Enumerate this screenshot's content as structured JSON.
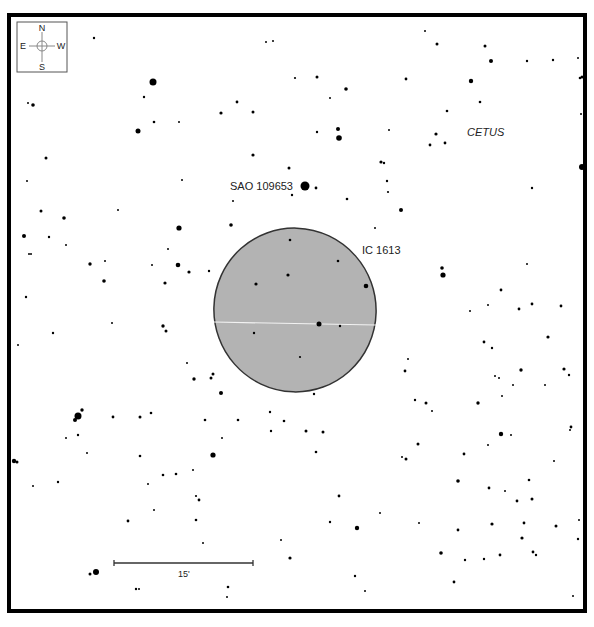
{
  "chart": {
    "type": "star-chart",
    "frame": {
      "x": 9,
      "y": 15,
      "w": 576,
      "h": 596,
      "stroke": "#000000",
      "stroke_width": 4
    },
    "compass": {
      "x": 17,
      "y": 22,
      "w": 50,
      "h": 50,
      "labels": {
        "north": "N",
        "south": "S",
        "east": "E",
        "west": "W"
      }
    },
    "object": {
      "name": "IC 1613",
      "label_x": 362,
      "label_y": 254,
      "ellipse": {
        "cx": 295,
        "cy": 310,
        "rx": 81,
        "ry": 82,
        "rotate": -20
      },
      "fill": "#b3b3b3",
      "stroke": "#333333"
    },
    "labels": [
      {
        "name": "sao-star-label",
        "text": "SAO 109653",
        "x": 230,
        "y": 190,
        "size": 11,
        "italic": false
      },
      {
        "name": "constellation-label",
        "text": "CETUS",
        "x": 467,
        "y": 136,
        "size": 11,
        "italic": true
      },
      {
        "name": "scale-label",
        "text": "15'",
        "x": 178,
        "y": 577,
        "size": 9,
        "italic": false
      }
    ],
    "scale_bar": {
      "x1": 114,
      "x2": 253,
      "y": 563,
      "label": "15'"
    },
    "caption": ""
  },
  "chart_data": {
    "type": "scatter",
    "annotations": [
      "IC 1613",
      "SAO 109653",
      "CETUS",
      "15'"
    ],
    "stars": [
      [
        94,
        38,
        1.2
      ],
      [
        266,
        42,
        1
      ],
      [
        273,
        41,
        1
      ],
      [
        425,
        31,
        1
      ],
      [
        437,
        44,
        1.5
      ],
      [
        485,
        46,
        1.5
      ],
      [
        317,
        77,
        1.5
      ],
      [
        553,
        60,
        1.2
      ],
      [
        578,
        58,
        1
      ],
      [
        580,
        78,
        1.3
      ],
      [
        153,
        82,
        3.5
      ],
      [
        28,
        103,
        1
      ],
      [
        33,
        105,
        1.8
      ],
      [
        144,
        97,
        1.2
      ],
      [
        471,
        81,
        2.2
      ],
      [
        491,
        61,
        2
      ],
      [
        527,
        61,
        1.2
      ],
      [
        581,
        114,
        1
      ],
      [
        582,
        77,
        1.5
      ],
      [
        138,
        131,
        2.5
      ],
      [
        154,
        122,
        1.3
      ],
      [
        179,
        122,
        1
      ],
      [
        221,
        113,
        1.6
      ],
      [
        237,
        102,
        1.4
      ],
      [
        253,
        112,
        1.5
      ],
      [
        346,
        89,
        1.8
      ],
      [
        295,
        78,
        1.1
      ],
      [
        338,
        129,
        2
      ],
      [
        317,
        132,
        1.2
      ],
      [
        339,
        138,
        2.8
      ],
      [
        389,
        130,
        1
      ],
      [
        436,
        134,
        1.6
      ],
      [
        445,
        143,
        1.4
      ],
      [
        430,
        145,
        1.4
      ],
      [
        406,
        79,
        1.4
      ],
      [
        447,
        111,
        1.3
      ],
      [
        480,
        102,
        1.3
      ],
      [
        46,
        158,
        1.5
      ],
      [
        27,
        181,
        1
      ],
      [
        182,
        180,
        1
      ],
      [
        253,
        155,
        1.6
      ],
      [
        289,
        168,
        1.5
      ],
      [
        381,
        162,
        1.6
      ],
      [
        384,
        163,
        1.2
      ],
      [
        387,
        181,
        1.2
      ],
      [
        388,
        192,
        1.1
      ],
      [
        305,
        186,
        4.5
      ],
      [
        316,
        188,
        1.4
      ],
      [
        347,
        199,
        1.3
      ],
      [
        330,
        98,
        1
      ],
      [
        233,
        201,
        1
      ],
      [
        375,
        228,
        1
      ],
      [
        401,
        210,
        2
      ],
      [
        532,
        188,
        1.2
      ],
      [
        582,
        167,
        3
      ],
      [
        41,
        211,
        1.5
      ],
      [
        24,
        236,
        2
      ],
      [
        64,
        218,
        1.8
      ],
      [
        49,
        237,
        1.2
      ],
      [
        118,
        210,
        1
      ],
      [
        231,
        225,
        1.8
      ],
      [
        179,
        228,
        2.6
      ],
      [
        292,
        195,
        1.2
      ],
      [
        26,
        297,
        1.2
      ],
      [
        90,
        264,
        1.7
      ],
      [
        105,
        261,
        1
      ],
      [
        152,
        265,
        1
      ],
      [
        168,
        249,
        1
      ],
      [
        178,
        265,
        2.3
      ],
      [
        189,
        272,
        1.6
      ],
      [
        165,
        283,
        1.6
      ],
      [
        209,
        271,
        1.2
      ],
      [
        104,
        281,
        1.8
      ],
      [
        66,
        245,
        1
      ],
      [
        31,
        254,
        1
      ],
      [
        29,
        254,
        1
      ],
      [
        163,
        326,
        1.7
      ],
      [
        166,
        331,
        1.5
      ],
      [
        112,
        323,
        1
      ],
      [
        53,
        333,
        1.2
      ],
      [
        18,
        345,
        1
      ],
      [
        256,
        284,
        1.6
      ],
      [
        288,
        275,
        1.6
      ],
      [
        338,
        261,
        1.3
      ],
      [
        366,
        286,
        2.3
      ],
      [
        290,
        240,
        1.3
      ],
      [
        442,
        268,
        1.8
      ],
      [
        443,
        275,
        2.6
      ],
      [
        527,
        264,
        1
      ],
      [
        501,
        290,
        1.4
      ],
      [
        488,
        305,
        1
      ],
      [
        519,
        309,
        1.4
      ],
      [
        561,
        306,
        1.4
      ],
      [
        532,
        304,
        1.4
      ],
      [
        548,
        337,
        1.6
      ],
      [
        484,
        342,
        1.4
      ],
      [
        492,
        348,
        1.2
      ],
      [
        470,
        311,
        1
      ],
      [
        545,
        385,
        1
      ],
      [
        521,
        370,
        1.7
      ],
      [
        408,
        359,
        1
      ],
      [
        405,
        371,
        1.4
      ],
      [
        495,
        376,
        1
      ],
      [
        499,
        378,
        1
      ],
      [
        502,
        396,
        1
      ],
      [
        564,
        369,
        1.6
      ],
      [
        570,
        430,
        1
      ],
      [
        569,
        375,
        1.2
      ],
      [
        478,
        403,
        1.7
      ],
      [
        513,
        385,
        1
      ],
      [
        319,
        324,
        2.5
      ],
      [
        340,
        326,
        1.2
      ],
      [
        254,
        333,
        1.2
      ],
      [
        300,
        357,
        1.1
      ],
      [
        314,
        394,
        1.2
      ],
      [
        213,
        374,
        1.5
      ],
      [
        211,
        378,
        1.5
      ],
      [
        187,
        363,
        1
      ],
      [
        194,
        379,
        1.7
      ],
      [
        221,
        393,
        2
      ],
      [
        415,
        400,
        1.2
      ],
      [
        426,
        403,
        1.5
      ],
      [
        432,
        411,
        1
      ],
      [
        78,
        416,
        3.5
      ],
      [
        75,
        420,
        2
      ],
      [
        82,
        410,
        1.7
      ],
      [
        113,
        417,
        1.4
      ],
      [
        66,
        438,
        1
      ],
      [
        78,
        435,
        1.2
      ],
      [
        87,
        453,
        1
      ],
      [
        58,
        482,
        1.2
      ],
      [
        14,
        461,
        2.2
      ],
      [
        17,
        462,
        1.5
      ],
      [
        33,
        486,
        1
      ],
      [
        140,
        417,
        1.5
      ],
      [
        151,
        413,
        1.3
      ],
      [
        205,
        420,
        1.3
      ],
      [
        238,
        420,
        1.3
      ],
      [
        270,
        412,
        1.2
      ],
      [
        271,
        431,
        1.2
      ],
      [
        284,
        421,
        1.3
      ],
      [
        306,
        431,
        1.5
      ],
      [
        323,
        432,
        1.5
      ],
      [
        316,
        452,
        1.3
      ],
      [
        222,
        438,
        1
      ],
      [
        213,
        455,
        2.6
      ],
      [
        163,
        475,
        1.3
      ],
      [
        148,
        484,
        1
      ],
      [
        176,
        474,
        1.3
      ],
      [
        193,
        470,
        1
      ],
      [
        140,
        456,
        1.3
      ],
      [
        199,
        500,
        1.4
      ],
      [
        196,
        520,
        1.3
      ],
      [
        203,
        543,
        1
      ],
      [
        128,
        521,
        1.4
      ],
      [
        154,
        510,
        1
      ],
      [
        196,
        496,
        1.1
      ],
      [
        330,
        522,
        1.2
      ],
      [
        339,
        496,
        1.4
      ],
      [
        357,
        528,
        2.2
      ],
      [
        380,
        513,
        1
      ],
      [
        355,
        576,
        1.2
      ],
      [
        365,
        591,
        1
      ],
      [
        281,
        540,
        1
      ],
      [
        290,
        558,
        1.6
      ],
      [
        228,
        587,
        1.3
      ],
      [
        96,
        572,
        3
      ],
      [
        90,
        574,
        1.5
      ],
      [
        136,
        589,
        1.2
      ],
      [
        139,
        589,
        1
      ],
      [
        227,
        597,
        1
      ],
      [
        402,
        457,
        1
      ],
      [
        406,
        459,
        1.5
      ],
      [
        418,
        444,
        1.5
      ],
      [
        419,
        523,
        1
      ],
      [
        441,
        553,
        1.8
      ],
      [
        464,
        454,
        1.4
      ],
      [
        458,
        530,
        1.4
      ],
      [
        465,
        560,
        1.2
      ],
      [
        488,
        445,
        1
      ],
      [
        492,
        524,
        1.6
      ],
      [
        511,
        435,
        1
      ],
      [
        517,
        501,
        1.4
      ],
      [
        500,
        555,
        1.4
      ],
      [
        501,
        434,
        2.2
      ],
      [
        524,
        523,
        1.4
      ],
      [
        532,
        499,
        1.5
      ],
      [
        556,
        526,
        1.5
      ],
      [
        536,
        555,
        1.2
      ],
      [
        571,
        427,
        1.4
      ],
      [
        505,
        491,
        1
      ],
      [
        454,
        582,
        1.4
      ],
      [
        484,
        559,
        1.2
      ],
      [
        573,
        596,
        1
      ],
      [
        579,
        520,
        1
      ],
      [
        578,
        539,
        1.2
      ],
      [
        585,
        574,
        1.8
      ],
      [
        554,
        461,
        1
      ],
      [
        489,
        488,
        1.4
      ],
      [
        522,
        538,
        1.6
      ],
      [
        458,
        481,
        1.8
      ],
      [
        529,
        480,
        1.3
      ],
      [
        533,
        552,
        1.4
      ]
    ]
  }
}
